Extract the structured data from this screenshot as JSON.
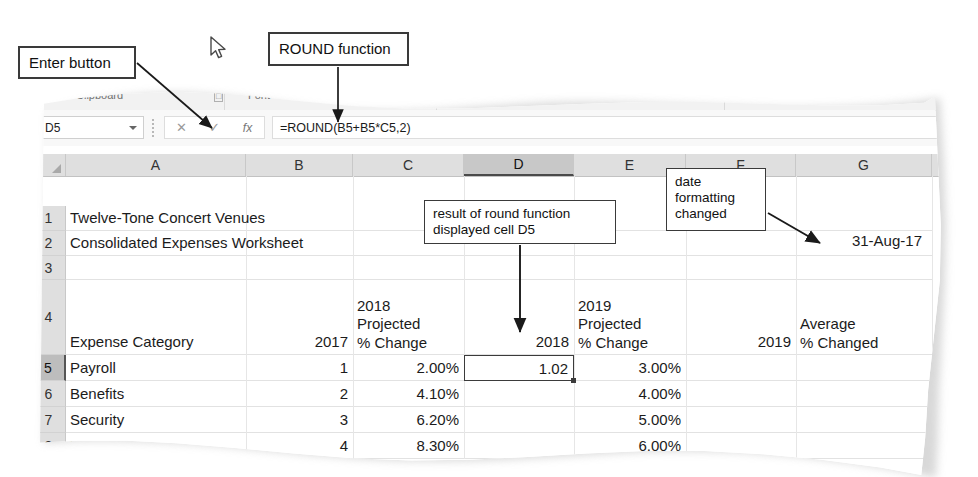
{
  "figure": {
    "app": "Microsoft Excel",
    "style": "torn-paper textbook figure"
  },
  "callouts": [
    {
      "id": "enter-button",
      "text": "Enter button"
    },
    {
      "id": "round-function",
      "text": "ROUND function"
    },
    {
      "id": "result-round",
      "text": "result of round function\ndisplayed cell D5"
    },
    {
      "id": "date-format",
      "text": "date\nformatting\nchanged"
    }
  ],
  "ribbon": {
    "groups": [
      {
        "label": "Clipboard",
        "x": 76
      },
      {
        "label": "Font",
        "x": 248
      },
      {
        "label": "Alignment",
        "x": 616
      },
      {
        "label": "Number",
        "x": 740
      }
    ],
    "dialog_launchers": [
      {
        "x": 214
      },
      {
        "x": 712
      }
    ]
  },
  "formula_bar": {
    "name_box_value": "D5",
    "cancel_label": "✕",
    "enter_label": "✓",
    "insert_function_label": "fx",
    "formula": "=ROUND(B5+B5*C5,2)"
  },
  "grid": {
    "columns": [
      {
        "letter": "A",
        "left": 66,
        "width": 180,
        "selected": false
      },
      {
        "letter": "B",
        "left": 246,
        "width": 107,
        "selected": false
      },
      {
        "letter": "C",
        "left": 353,
        "width": 111,
        "selected": false
      },
      {
        "letter": "D",
        "left": 464,
        "width": 110,
        "selected": true
      },
      {
        "letter": "E",
        "left": 574,
        "width": 112,
        "selected": false
      },
      {
        "letter": "F",
        "left": 686,
        "width": 110,
        "selected": false
      },
      {
        "letter": "G",
        "left": 796,
        "width": 136,
        "selected": false
      }
    ],
    "rows": [
      {
        "number": "1",
        "top": 30,
        "height": 25,
        "selected": false
      },
      {
        "number": "2",
        "top": 55,
        "height": 25,
        "selected": false
      },
      {
        "number": "3",
        "top": 80,
        "height": 24,
        "selected": false
      },
      {
        "number": "4",
        "top": 104,
        "height": 75,
        "selected": false
      },
      {
        "number": "5",
        "top": 179,
        "height": 26,
        "selected": true
      },
      {
        "number": "6",
        "top": 205,
        "height": 26,
        "selected": false
      },
      {
        "number": "7",
        "top": 231,
        "height": 26,
        "selected": false
      },
      {
        "number": "8",
        "top": 257,
        "height": 26,
        "selected": false
      }
    ],
    "cells": [
      {
        "ref": "A1",
        "text": "Twelve-Tone Concert Venues",
        "align": "left",
        "col": 0,
        "row": 0,
        "span": 3
      },
      {
        "ref": "A2",
        "text": "Consolidated Expenses Worksheet",
        "align": "left",
        "col": 0,
        "row": 1,
        "span": 3
      },
      {
        "ref": "A4",
        "text": "Expense Category",
        "align": "left",
        "col": 0,
        "row": 3
      },
      {
        "ref": "B4",
        "text": "2017",
        "align": "right",
        "col": 1,
        "row": 3
      },
      {
        "ref": "C4",
        "text": "2018\nProjected\n% Change",
        "align": "left",
        "col": 2,
        "row": 3
      },
      {
        "ref": "D4",
        "text": "2018",
        "align": "right",
        "col": 3,
        "row": 3
      },
      {
        "ref": "E4",
        "text": "2019\nProjected\n% Change",
        "align": "left",
        "col": 4,
        "row": 3
      },
      {
        "ref": "F4",
        "text": "2019",
        "align": "right",
        "col": 5,
        "row": 3
      },
      {
        "ref": "G4",
        "text": "Average\n% Changed",
        "align": "left",
        "col": 6,
        "row": 3
      },
      {
        "ref": "A5",
        "text": "Payroll",
        "align": "left",
        "col": 0,
        "row": 4
      },
      {
        "ref": "B5",
        "text": "1",
        "align": "right",
        "col": 1,
        "row": 4
      },
      {
        "ref": "C5",
        "text": "2.00%",
        "align": "right",
        "col": 2,
        "row": 4
      },
      {
        "ref": "E5",
        "text": "3.00%",
        "align": "right",
        "col": 4,
        "row": 4
      },
      {
        "ref": "A6",
        "text": "Benefits",
        "align": "left",
        "col": 0,
        "row": 5
      },
      {
        "ref": "B6",
        "text": "2",
        "align": "right",
        "col": 1,
        "row": 5
      },
      {
        "ref": "C6",
        "text": "4.10%",
        "align": "right",
        "col": 2,
        "row": 5
      },
      {
        "ref": "E6",
        "text": "4.00%",
        "align": "right",
        "col": 4,
        "row": 5
      },
      {
        "ref": "A7",
        "text": "Security",
        "align": "left",
        "col": 0,
        "row": 6
      },
      {
        "ref": "B7",
        "text": "3",
        "align": "right",
        "col": 1,
        "row": 6
      },
      {
        "ref": "C7",
        "text": "6.20%",
        "align": "right",
        "col": 2,
        "row": 6
      },
      {
        "ref": "E7",
        "text": "5.00%",
        "align": "right",
        "col": 4,
        "row": 6
      },
      {
        "ref": "A8",
        "text": "Rent",
        "align": "left",
        "col": 0,
        "row": 7
      },
      {
        "ref": "B8",
        "text": "4",
        "align": "right",
        "col": 1,
        "row": 7
      },
      {
        "ref": "C8",
        "text": "8.30%",
        "align": "right",
        "col": 2,
        "row": 7
      },
      {
        "ref": "E8",
        "text": "6.00%",
        "align": "right",
        "col": 4,
        "row": 7
      }
    ],
    "date_cell": {
      "ref": "G3",
      "text": "31-Aug-17"
    },
    "active_cell": {
      "ref": "D5",
      "value": "1.02"
    }
  },
  "colors": {
    "header_fill": "#dfdfdf",
    "selected_header_fill": "#c8c8c8",
    "gridline": "#e2e2e2",
    "callout_border": "#3a3a3a",
    "text": "#1b1b1b"
  }
}
